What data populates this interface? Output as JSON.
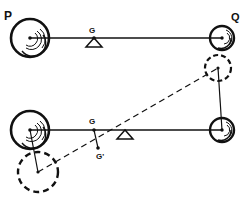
{
  "diagram": {
    "type": "lever-balance",
    "colors": {
      "ink": "#111111",
      "background": "#ffffff"
    },
    "top": {
      "labels": {
        "P": "P",
        "Q": "Q",
        "G": "G"
      },
      "mass_P": {
        "cx": 30,
        "cy": 38,
        "r": 19
      },
      "mass_Q": {
        "cx": 222,
        "cy": 38,
        "r": 12
      },
      "beam": {
        "x1": 30,
        "y1": 38,
        "x2": 222,
        "y2": 38
      },
      "fulcrum": {
        "x": 94,
        "y": 38
      },
      "G_point": {
        "x": 94,
        "y": 38
      }
    },
    "bottom": {
      "labels": {
        "G": "G",
        "G_prime": "G'"
      },
      "mass_P": {
        "cx": 30,
        "cy": 130,
        "r": 19
      },
      "mass_Q": {
        "cx": 222,
        "cy": 130,
        "r": 12
      },
      "beam": {
        "x1": 30,
        "y1": 130,
        "x2": 222,
        "y2": 130
      },
      "fulcrum": {
        "x": 125,
        "y": 130
      },
      "G_point": {
        "x": 94,
        "y": 130
      },
      "G_prime_point": {
        "x": 98,
        "y": 148
      },
      "displaced_P": {
        "cx": 38,
        "cy": 172,
        "r": 20
      },
      "displaced_Q": {
        "cx": 218,
        "cy": 68,
        "r": 13
      },
      "displaced_beam": {
        "x1": 38,
        "y1": 172,
        "x2": 218,
        "y2": 68
      }
    }
  }
}
